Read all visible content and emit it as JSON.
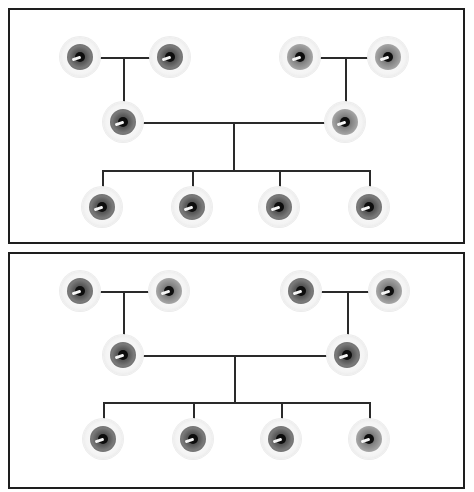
{
  "diagram": {
    "type": "pedigree",
    "colors": {
      "border": "#1e1e1e",
      "connector": "#2a2a2a",
      "iris_dark": "#6a6a6a",
      "iris_light": "#9a9a9a",
      "pupil": "#0d0d0d"
    },
    "panels": [
      {
        "id": "top",
        "grandparents_left": [
          {
            "x": 80,
            "y": 57,
            "iris": "dark"
          },
          {
            "x": 170,
            "y": 57,
            "iris": "dark"
          }
        ],
        "grandparents_right": [
          {
            "x": 300,
            "y": 57,
            "iris": "light"
          },
          {
            "x": 388,
            "y": 57,
            "iris": "light"
          }
        ],
        "parents": [
          {
            "x": 123,
            "y": 122,
            "iris": "dark"
          },
          {
            "x": 345,
            "y": 122,
            "iris": "light"
          }
        ],
        "children": [
          {
            "x": 102,
            "y": 207,
            "iris": "dark"
          },
          {
            "x": 192,
            "y": 207,
            "iris": "dark"
          },
          {
            "x": 279,
            "y": 207,
            "iris": "dark"
          },
          {
            "x": 369,
            "y": 207,
            "iris": "dark"
          }
        ]
      },
      {
        "id": "bottom",
        "grandparents_left": [
          {
            "x": 80,
            "y": 291,
            "iris": "dark"
          },
          {
            "x": 169,
            "y": 291,
            "iris": "light"
          }
        ],
        "grandparents_right": [
          {
            "x": 301,
            "y": 291,
            "iris": "dark"
          },
          {
            "x": 389,
            "y": 291,
            "iris": "light"
          }
        ],
        "parents": [
          {
            "x": 123,
            "y": 355,
            "iris": "dark"
          },
          {
            "x": 347,
            "y": 355,
            "iris": "dark"
          }
        ],
        "children": [
          {
            "x": 103,
            "y": 439,
            "iris": "dark"
          },
          {
            "x": 193,
            "y": 439,
            "iris": "dark"
          },
          {
            "x": 281,
            "y": 439,
            "iris": "dark"
          },
          {
            "x": 369,
            "y": 439,
            "iris": "light"
          }
        ]
      }
    ]
  }
}
